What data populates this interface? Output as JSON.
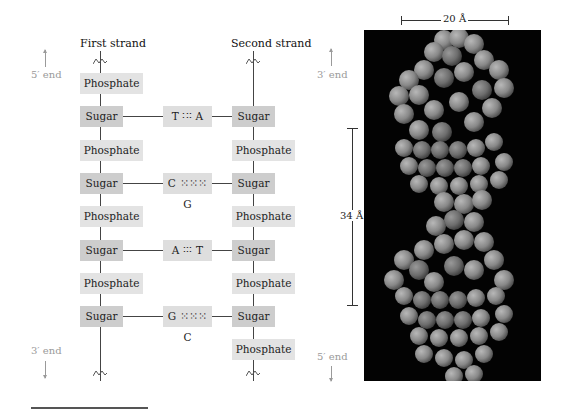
{
  "diagram": {
    "first_strand": {
      "title": "First strand",
      "top_end": "5′ end",
      "bottom_end": "3′ end",
      "units": [
        "Phosphate",
        "Sugar",
        "Phosphate",
        "Sugar",
        "Phosphate",
        "Sugar",
        "Phosphate",
        "Sugar"
      ]
    },
    "second_strand": {
      "title": "Second strand",
      "top_end": "3′ end",
      "bottom_end": "5′ end",
      "units": [
        "Sugar",
        "Phosphate",
        "Sugar",
        "Phosphate",
        "Sugar",
        "Phosphate",
        "Sugar",
        "Phosphate"
      ]
    },
    "base_pairs": [
      "T ∶∶∶ A",
      "C ⁙⁙⁙ G",
      "A ∶∶∶ T",
      "G ⁙⁙⁙ C"
    ],
    "colors": {
      "sugar_box": "#cdcdcd",
      "phosphate_box": "#e3e3e3",
      "pair_box": "#dedede",
      "end_label": "#9a9a9a",
      "model_background": "#030303",
      "atom_gray": "#8a8a8a"
    }
  },
  "model": {
    "width_label": "20 Å",
    "pitch_label": "34 Å"
  }
}
